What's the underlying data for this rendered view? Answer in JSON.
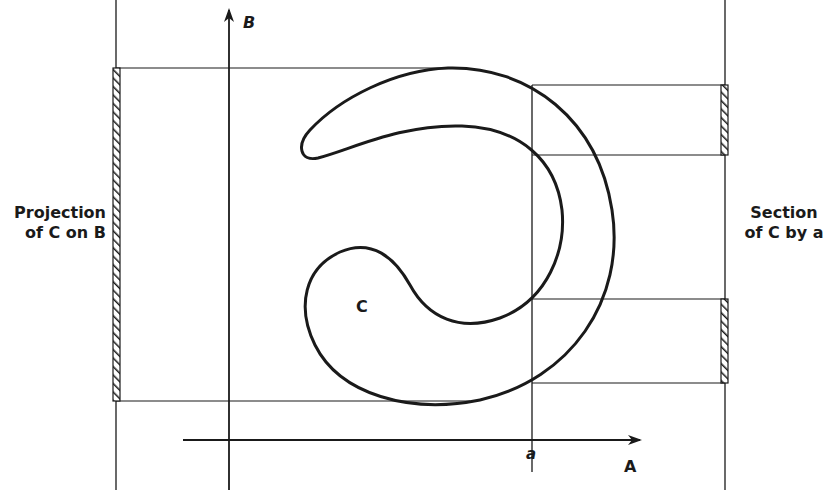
{
  "diagram": {
    "axes": {
      "horizontal_label": "A",
      "vertical_label": "B"
    },
    "shape_label": "C",
    "section_line_label": "a",
    "left_annotation": {
      "line1": "Projection",
      "line2": "of C on B"
    },
    "right_annotation": {
      "line1": "Section",
      "line2": "of C by a"
    },
    "colors": {
      "ink": "#1a1a1a",
      "background": "#ffffff"
    }
  }
}
